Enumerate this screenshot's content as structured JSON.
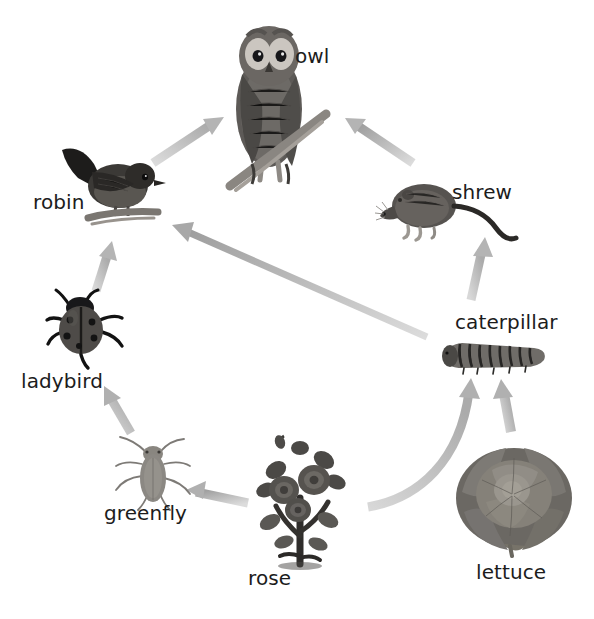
{
  "diagram": {
    "type": "food-web",
    "title": "",
    "background_color": "#ffffff",
    "arrow_color": "#b9b9b9",
    "arrow_color_dark": "#a3a3a3",
    "label_color": "#1c1c1c",
    "width": 594,
    "height": 619
  },
  "nodes": [
    {
      "id": "owl",
      "label": "owl",
      "icon": "owl-icon",
      "label_x": 295,
      "label_y": 44,
      "art_x": 222,
      "art_y": 14,
      "art_w": 110,
      "art_h": 180,
      "trophic_level": "tertiary consumer"
    },
    {
      "id": "robin",
      "label": "robin",
      "icon": "robin-icon",
      "label_x": 33,
      "label_y": 190,
      "art_x": 58,
      "art_y": 138,
      "art_w": 108,
      "art_h": 90,
      "trophic_level": "secondary consumer"
    },
    {
      "id": "shrew",
      "label": "shrew",
      "icon": "shrew-icon",
      "label_x": 452,
      "label_y": 180,
      "art_x": 378,
      "art_y": 180,
      "art_w": 135,
      "art_h": 70,
      "trophic_level": "secondary consumer"
    },
    {
      "id": "ladybird",
      "label": "ladybird",
      "icon": "ladybird-icon",
      "label_x": 21,
      "label_y": 369,
      "art_x": 46,
      "art_y": 288,
      "art_w": 85,
      "art_h": 80,
      "trophic_level": "secondary consumer"
    },
    {
      "id": "caterpillar",
      "label": "caterpillar",
      "icon": "caterpillar-icon",
      "label_x": 455,
      "label_y": 310,
      "art_x": 440,
      "art_y": 334,
      "art_w": 110,
      "art_h": 40,
      "trophic_level": "primary consumer"
    },
    {
      "id": "greenfly",
      "label": "greenfly",
      "icon": "greenfly-icon",
      "label_x": 104,
      "label_y": 501,
      "art_x": 112,
      "art_y": 434,
      "art_w": 80,
      "art_h": 75,
      "trophic_level": "primary consumer"
    },
    {
      "id": "rose",
      "label": "rose",
      "icon": "rose-icon",
      "label_x": 248,
      "label_y": 566,
      "art_x": 250,
      "art_y": 436,
      "art_w": 100,
      "art_h": 130,
      "trophic_level": "producer"
    },
    {
      "id": "lettuce",
      "label": "lettuce",
      "icon": "lettuce-icon",
      "label_x": 476,
      "label_y": 560,
      "art_x": 452,
      "art_y": 440,
      "art_w": 120,
      "art_h": 115,
      "trophic_level": "producer"
    }
  ],
  "arrows": [
    {
      "id": "rose-to-greenfly",
      "from": "rose",
      "to": "greenfly",
      "style": "straight"
    },
    {
      "id": "greenfly-to-ladybird",
      "from": "greenfly",
      "to": "ladybird",
      "style": "straight"
    },
    {
      "id": "ladybird-to-robin",
      "from": "ladybird",
      "to": "robin",
      "style": "straight"
    },
    {
      "id": "robin-to-owl",
      "from": "robin",
      "to": "owl",
      "style": "straight"
    },
    {
      "id": "rose-to-caterpillar",
      "from": "rose",
      "to": "caterpillar",
      "style": "curved"
    },
    {
      "id": "lettuce-to-caterpillar",
      "from": "lettuce",
      "to": "caterpillar",
      "style": "straight"
    },
    {
      "id": "caterpillar-to-shrew",
      "from": "caterpillar",
      "to": "shrew",
      "style": "straight"
    },
    {
      "id": "caterpillar-to-robin",
      "from": "caterpillar",
      "to": "robin",
      "style": "straight"
    },
    {
      "id": "shrew-to-owl",
      "from": "shrew",
      "to": "owl",
      "style": "straight"
    }
  ]
}
